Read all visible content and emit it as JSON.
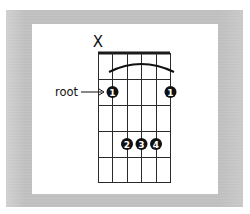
{
  "diagram": {
    "type": "guitar-chord-chart",
    "muted_string_marker": "X",
    "muted_string_index": 0,
    "strings": 6,
    "frets_shown": 5,
    "barre_arc": {
      "from_string": 1,
      "to_string": 5
    },
    "root_label": "root",
    "fingers": [
      {
        "string": 1,
        "fret": 1,
        "label": "1",
        "root": true
      },
      {
        "string": 5,
        "fret": 1,
        "label": "1",
        "root": false
      },
      {
        "string": 2,
        "fret": 3,
        "label": "2",
        "root": false
      },
      {
        "string": 3,
        "fret": 3,
        "label": "3",
        "root": false
      },
      {
        "string": 4,
        "fret": 3,
        "label": "4",
        "root": false
      }
    ],
    "colors": {
      "line": "#1a1a1a",
      "dot": "#111111",
      "dot_text": "#ffffff",
      "frame": "#bfbfbf",
      "panel": "#ffffff"
    }
  }
}
